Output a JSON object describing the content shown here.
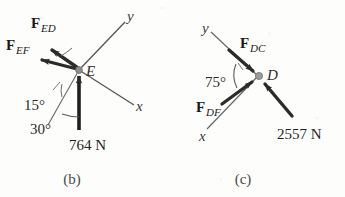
{
  "figure": {
    "background_color": "#fdfdfc",
    "stroke_color": "#4a4a4a",
    "arrow_color": "#2b2b2b",
    "node_color": "#8f8f8f"
  },
  "panels": [
    {
      "id": "b",
      "caption": "(b)",
      "node": {
        "label": "E",
        "name": "joint-e"
      },
      "axes": [
        {
          "label": "y",
          "direction": "up-right"
        },
        {
          "label": "x",
          "direction": "down-right"
        }
      ],
      "forces": [
        {
          "symbol": "F",
          "subscript": "ED",
          "label": "F_ED",
          "direction": "up-left",
          "sense": "away-from-joint"
        },
        {
          "symbol": "F",
          "subscript": "EF",
          "label": "F_EF",
          "direction": "up-left-shallow",
          "sense": "away-from-joint"
        },
        {
          "symbol": "",
          "subscript": "",
          "label": "764 N",
          "magnitude": 764,
          "unit": "N",
          "direction": "up",
          "sense": "toward-joint"
        }
      ],
      "angles": [
        {
          "label": "15°",
          "value": 15,
          "unit": "deg"
        },
        {
          "label": "30°",
          "value": 30,
          "unit": "deg"
        }
      ]
    },
    {
      "id": "c",
      "caption": "(c)",
      "node": {
        "label": "D",
        "name": "joint-d"
      },
      "axes": [
        {
          "label": "y",
          "direction": "up-left"
        },
        {
          "label": "x",
          "direction": "down-left"
        }
      ],
      "forces": [
        {
          "symbol": "F",
          "subscript": "DC",
          "label": "F_DC",
          "direction": "down-right",
          "sense": "toward-joint"
        },
        {
          "symbol": "F",
          "subscript": "DF",
          "label": "F_DF",
          "direction": "up-right",
          "sense": "toward-joint"
        },
        {
          "symbol": "",
          "subscript": "",
          "label": "2557 N",
          "magnitude": 2557,
          "unit": "N",
          "direction": "up-left",
          "sense": "toward-joint"
        }
      ],
      "angles": [
        {
          "label": "75°",
          "value": 75,
          "unit": "deg"
        }
      ]
    }
  ]
}
